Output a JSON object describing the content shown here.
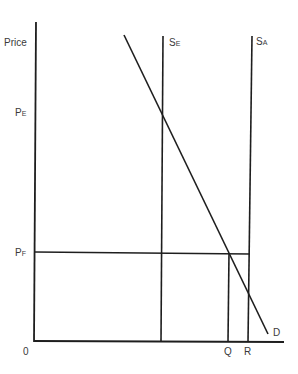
{
  "diagram": {
    "y_axis_label": "Price",
    "origin_label": "0",
    "price_labels": [
      {
        "main": "P",
        "sub": "E"
      },
      {
        "main": "P",
        "sub": "F"
      }
    ],
    "supply_labels": [
      {
        "main": "S",
        "sub": "E"
      },
      {
        "main": "S",
        "sub": "A"
      }
    ],
    "quantity_labels": [
      "Q",
      "R"
    ],
    "demand_label": "D"
  }
}
